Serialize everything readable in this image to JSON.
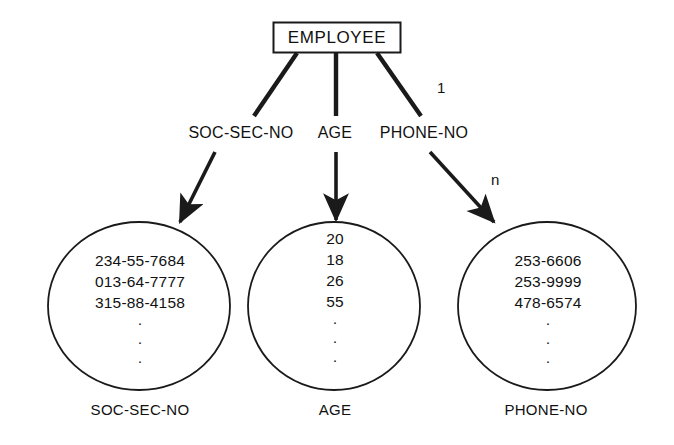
{
  "diagram": {
    "type": "entity-attribute-value-set",
    "entity": {
      "name": "EMPLOYEE"
    },
    "attributes": [
      {
        "name": "SOC-SEC-NO",
        "caption": "SOC-SEC-NO",
        "cardinality_from": "",
        "cardinality_to": "",
        "values": [
          "234-55-7684",
          "013-64-7777",
          "315-88-4158"
        ],
        "ellipsis": "·"
      },
      {
        "name": "AGE",
        "caption": "AGE",
        "cardinality_from": "",
        "cardinality_to": "",
        "values": [
          "20",
          "18",
          "26",
          "55"
        ],
        "ellipsis": "·"
      },
      {
        "name": "PHONE-NO",
        "caption": "PHONE-NO",
        "cardinality_from": "1",
        "cardinality_to": "n",
        "values": [
          "253-6606",
          "253-9999",
          "478-6574"
        ],
        "ellipsis": "·"
      }
    ],
    "colors": {
      "background": "#ffffff",
      "stroke": "#1a1a1a",
      "text": "#111111"
    }
  }
}
